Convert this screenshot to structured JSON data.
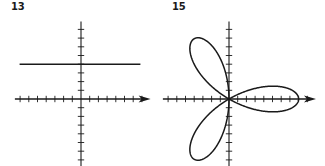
{
  "chart_data": [
    {
      "type": "line",
      "id": "13",
      "title": "13",
      "description": "Horizontal line in the Cartesian plane",
      "equation": "y = 4",
      "xlabel": "",
      "ylabel": "",
      "xlim": [
        -7,
        8
      ],
      "ylim": [
        -8,
        8
      ],
      "grid": false,
      "tick_interval": 1,
      "x_ticks_left": 7,
      "x_ticks_right": 7,
      "y_ticks_up": 8,
      "y_ticks_down": 8,
      "series": [
        {
          "name": "graph",
          "x": [
            -7,
            7
          ],
          "y": [
            4,
            4
          ]
        }
      ],
      "legend": null
    },
    {
      "type": "line",
      "id": "15",
      "title": "15",
      "description": "Three-petal rose curve with petals at 0, 120 and 240 degrees",
      "equation": "r = 8cos(3θ)",
      "xlabel": "",
      "ylabel": "",
      "xlim": [
        -7,
        9
      ],
      "ylim": [
        -8,
        8
      ],
      "grid": false,
      "tick_interval": 1,
      "x_ticks_left": 7,
      "x_ticks_right": 9,
      "y_ticks_up": 8,
      "y_ticks_down": 8,
      "petals": 3,
      "petal_length": 8,
      "petal_angles_deg": [
        0,
        120,
        240
      ],
      "series": [
        {
          "name": "rose",
          "polar": true,
          "r_amplitude": 8,
          "k": 3
        }
      ],
      "legend": null
    }
  ],
  "panels": [
    {
      "label": "13"
    },
    {
      "label": "15"
    }
  ],
  "style": {
    "stroke_color": "#1a1a1a",
    "background": "#ffffff"
  }
}
